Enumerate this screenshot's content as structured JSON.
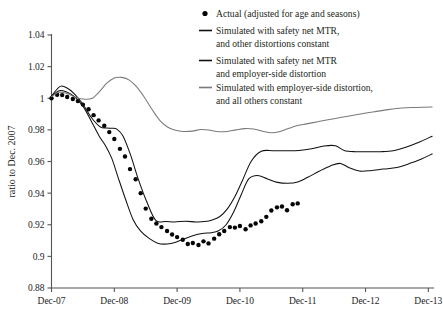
{
  "figure": {
    "y_axis_title": "ratio to Dec. 2007"
  },
  "legend": {
    "position": "top-right",
    "entries": [
      {
        "marker": "dot",
        "color": "#050505",
        "label": "Actual (adjusted for age and seasons)"
      },
      {
        "marker": "line",
        "color": "#111111",
        "label": "Simulated with safety net MTR,",
        "label2": "and other distortions constant"
      },
      {
        "marker": "line",
        "color": "#111111",
        "label": "Simulated with safety net MTR",
        "label2": "and employer-side distortion"
      },
      {
        "marker": "line",
        "color": "#7a7a7a",
        "label": "Simulated with employer-side distortion,",
        "label2": "and all others constant"
      }
    ]
  },
  "chart_data": {
    "type": "line",
    "title": "",
    "xlabel": "",
    "ylabel": "ratio to Dec. 2007",
    "grid": false,
    "legend_position": "top-right",
    "xlim": [
      2007.96,
      2014.05
    ],
    "ylim": [
      0.88,
      1.04
    ],
    "ytick_values": [
      0.88,
      0.9,
      0.92,
      0.94,
      0.96,
      0.98,
      1,
      1.02,
      1.04
    ],
    "ytick_labels": [
      "0.88",
      "0.9",
      "0.92",
      "0.94",
      "0.96",
      "0.98",
      "1",
      "1.02",
      "1.04"
    ],
    "xtick_values": [
      2007.96,
      2008.96,
      2009.96,
      2010.96,
      2011.96,
      2012.96,
      2013.96
    ],
    "xtick_labels": [
      "Dec-07",
      "Dec-08",
      "Dec-09",
      "Dec-10",
      "Dec-11",
      "Dec-12",
      "Dec-13"
    ],
    "series": [
      {
        "name": "Actual (adjusted for age and seasons)",
        "style": "scatter",
        "color": "#050505",
        "x": [
          2007.96,
          2008.05,
          2008.13,
          2008.21,
          2008.3,
          2008.38,
          2008.46,
          2008.55,
          2008.63,
          2008.71,
          2008.8,
          2008.88,
          2008.96,
          2009.05,
          2009.13,
          2009.21,
          2009.3,
          2009.38,
          2009.46,
          2009.55,
          2009.63,
          2009.71,
          2009.8,
          2009.88,
          2009.96,
          2010.05,
          2010.13,
          2010.21,
          2010.3,
          2010.38,
          2010.46,
          2010.55,
          2010.63,
          2010.71,
          2010.8,
          2010.88,
          2010.96,
          2011.05,
          2011.13,
          2011.21,
          2011.3,
          2011.38,
          2011.46,
          2011.55,
          2011.63,
          2011.71,
          2011.8,
          2011.88
        ],
        "y": [
          1.0,
          1.0022,
          1.002,
          1.0008,
          0.9995,
          0.9982,
          0.996,
          0.993,
          0.9893,
          0.986,
          0.9826,
          0.9786,
          0.9742,
          0.968,
          0.9632,
          0.9552,
          0.9488,
          0.94,
          0.9302,
          0.9238,
          0.9208,
          0.9185,
          0.916,
          0.9138,
          0.9122,
          0.9105,
          0.9078,
          0.9085,
          0.9072,
          0.9095,
          0.9082,
          0.9112,
          0.914,
          0.916,
          0.9185,
          0.9182,
          0.9192,
          0.9172,
          0.9196,
          0.9208,
          0.9222,
          0.925,
          0.929,
          0.931,
          0.9315,
          0.9292,
          0.933,
          0.9335
        ]
      },
      {
        "name": "Simulated with safety net MTR, and other distortions constant",
        "style": "line",
        "color": "#111111",
        "x": [
          2007.96,
          2008.1,
          2008.22,
          2008.32,
          2008.45,
          2008.6,
          2008.74,
          2008.84,
          2008.92,
          2009.0,
          2009.1,
          2009.22,
          2009.34,
          2009.48,
          2009.62,
          2009.78,
          2009.92,
          2010.1,
          2010.26,
          2010.4,
          2010.52,
          2010.64,
          2010.76,
          2010.88,
          2011.0,
          2011.14,
          2011.3,
          2011.5,
          2011.7,
          2011.9,
          2012.1,
          2012.3,
          2012.48,
          2012.62,
          2012.8,
          2013.0,
          2013.2,
          2013.4,
          2013.6,
          2013.8,
          2014.02
        ],
        "y": [
          1.0015,
          1.0075,
          1.0062,
          1.003,
          0.9968,
          0.9875,
          0.9818,
          0.9812,
          0.981,
          0.9805,
          0.976,
          0.964,
          0.949,
          0.9342,
          0.9228,
          0.922,
          0.9218,
          0.9222,
          0.9218,
          0.922,
          0.923,
          0.9252,
          0.93,
          0.9378,
          0.948,
          0.9602,
          0.9665,
          0.9668,
          0.9668,
          0.967,
          0.968,
          0.9698,
          0.97,
          0.967,
          0.9662,
          0.9662,
          0.9662,
          0.9668,
          0.969,
          0.972,
          0.976
        ]
      },
      {
        "name": "Simulated with safety net MTR and employer-side distortion",
        "style": "line",
        "color": "#111111",
        "x": [
          2007.96,
          2008.08,
          2008.2,
          2008.32,
          2008.46,
          2008.6,
          2008.72,
          2008.82,
          2008.92,
          2009.02,
          2009.14,
          2009.26,
          2009.38,
          2009.52,
          2009.66,
          2009.8,
          2009.94,
          2010.08,
          2010.22,
          2010.36,
          2010.5,
          2010.62,
          2010.74,
          2010.86,
          2010.98,
          2011.1,
          2011.24,
          2011.4,
          2011.56,
          2011.72,
          2011.88,
          2012.04,
          2012.22,
          2012.4,
          2012.56,
          2012.7,
          2012.86,
          2013.04,
          2013.24,
          2013.46,
          2013.68,
          2013.86,
          2014.02
        ],
        "y": [
          1.0012,
          1.0048,
          1.004,
          1.0012,
          0.995,
          0.985,
          0.976,
          0.97,
          0.962,
          0.95,
          0.936,
          0.9232,
          0.916,
          0.9112,
          0.9082,
          0.9078,
          0.909,
          0.9112,
          0.9132,
          0.9145,
          0.915,
          0.9162,
          0.92,
          0.928,
          0.939,
          0.949,
          0.9512,
          0.949,
          0.9468,
          0.9462,
          0.947,
          0.95,
          0.9538,
          0.9572,
          0.9588,
          0.956,
          0.954,
          0.9542,
          0.9552,
          0.9562,
          0.959,
          0.9618,
          0.9648
        ]
      },
      {
        "name": "Simulated with employer-side distortion, and all others constant",
        "style": "line",
        "color": "#7a7a7a",
        "x": [
          2007.96,
          2008.08,
          2008.2,
          2008.32,
          2008.46,
          2008.6,
          2008.72,
          2008.84,
          2008.96,
          2009.08,
          2009.2,
          2009.32,
          2009.44,
          2009.56,
          2009.68,
          2009.8,
          2009.92,
          2010.06,
          2010.2,
          2010.34,
          2010.48,
          2010.62,
          2010.76,
          2010.9,
          2011.04,
          2011.18,
          2011.32,
          2011.46,
          2011.6,
          2011.74,
          2011.88,
          2012.02,
          2012.18,
          2012.34,
          2012.52,
          2012.7,
          2012.9,
          2013.1,
          2013.32,
          2013.54,
          2013.76,
          2014.02
        ],
        "y": [
          1.001,
          1.0038,
          1.003,
          1.001,
          0.9995,
          0.9998,
          1.004,
          1.0095,
          1.0128,
          1.0132,
          1.0115,
          1.007,
          1.0005,
          0.993,
          0.9862,
          0.982,
          0.98,
          0.979,
          0.9792,
          0.9802,
          0.9798,
          0.9788,
          0.979,
          0.98,
          0.9808,
          0.9805,
          0.9792,
          0.9782,
          0.979,
          0.981,
          0.9828,
          0.9838,
          0.985,
          0.9862,
          0.9875,
          0.9888,
          0.9902,
          0.9915,
          0.9928,
          0.9938,
          0.9942,
          0.9945
        ]
      }
    ]
  }
}
